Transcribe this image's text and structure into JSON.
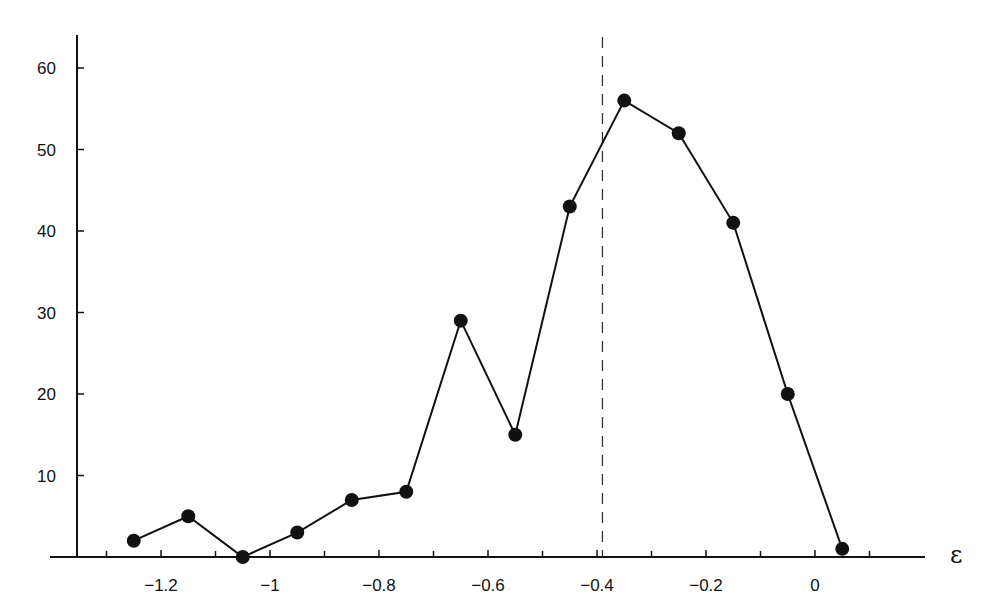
{
  "chart_data": {
    "type": "line",
    "title": "",
    "xlabel": "ε",
    "ylabel": "",
    "x": [
      -1.25,
      -1.15,
      -1.05,
      -0.95,
      -0.85,
      -0.75,
      -0.65,
      -0.55,
      -0.45,
      -0.35,
      -0.25,
      -0.15,
      -0.05,
      0.05
    ],
    "series": [
      {
        "name": "counts",
        "values": [
          2,
          5,
          0,
          3,
          7,
          8,
          29,
          15,
          43,
          56,
          52,
          41,
          20,
          1
        ],
        "marker": "filled-circle",
        "color": "#111111"
      }
    ],
    "reference_lines": [
      {
        "orientation": "vertical",
        "x": -0.39,
        "style": "dashed",
        "color": "#333333"
      }
    ],
    "xlim": [
      -1.4,
      0.2
    ],
    "ylim": [
      0,
      64
    ],
    "x_ticks": [
      -1.2,
      -1.0,
      -0.8,
      -0.6,
      -0.4,
      -0.2,
      0
    ],
    "x_tick_labels": [
      "−1.2",
      "−1",
      "−0.8",
      "−0.6",
      "−0.4",
      "−0.2",
      "0"
    ],
    "x_minor_ticks": [
      -1.3,
      -1.1,
      -0.9,
      -0.7,
      -0.5,
      -0.3,
      -0.1,
      0.1
    ],
    "y_ticks": [
      10,
      20,
      30,
      40,
      50,
      60
    ],
    "y_tick_labels": [
      "10",
      "20",
      "30",
      "40",
      "50",
      "60"
    ],
    "grid": false,
    "legend": null
  }
}
